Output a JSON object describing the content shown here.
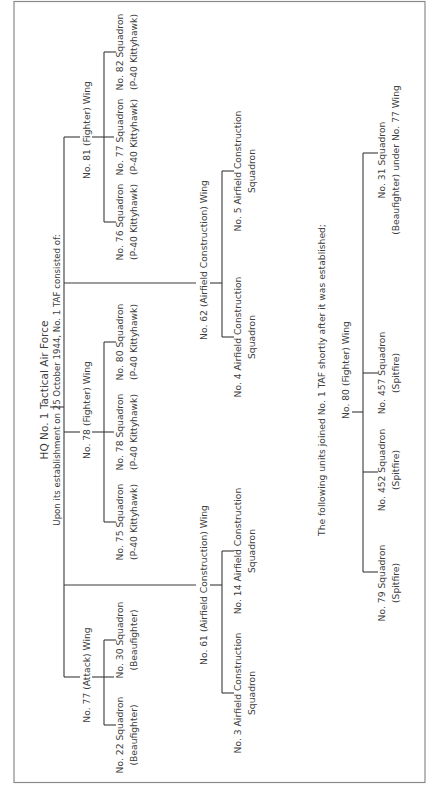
{
  "diagram": {
    "orientation": "rotated-90-ccw",
    "root": {
      "title": "HQ No. 1 Tactical Air Force",
      "subtitle": "Upon its establishment on 25 October 1944, No. 1 TAF consisted of:"
    },
    "wings": [
      {
        "name": "No. 81 (Fighter) Wing",
        "squadrons": [
          {
            "line1": "No. 76 Squadron",
            "line2": "(P-40 Kittyhawk)"
          },
          {
            "line1": "No. 77 Squadron",
            "line2": "(P-40 Kittyhawk)"
          },
          {
            "line1": "No. 82 Squadron",
            "line2": "(P-40 Kittyhawk)"
          }
        ]
      },
      {
        "name": "No. 78 (Fighter) Wing",
        "squadrons": [
          {
            "line1": "No. 75 Squadron",
            "line2": "(P-40 Kittyhawk)"
          },
          {
            "line1": "No. 78 Squadron",
            "line2": "(P-40 Kittyhawk)"
          },
          {
            "line1": "No. 80 Squadron",
            "line2": "(P-40 Kittyhawk)"
          }
        ]
      },
      {
        "name": "No. 77 (Attack) Wing",
        "squadrons": [
          {
            "line1": "No. 22 Squadron",
            "line2": "(Beaufighter)"
          },
          {
            "line1": "No. 30 Squadron",
            "line2": "(Beaufighter)"
          }
        ]
      },
      {
        "name": "No. 62 (Airfield Construction) Wing",
        "squadrons": [
          {
            "line1": "No. 4 Airfield Construction",
            "line2": "Squadron"
          },
          {
            "line1": "No. 5 Airfield Construction",
            "line2": "Squadron"
          }
        ]
      },
      {
        "name": "No. 61 (Airfield Construction) Wing",
        "squadrons": [
          {
            "line1": "No. 3 Airfield Construction",
            "line2": "Squadron"
          },
          {
            "line1": "No. 14 Airfield Construction",
            "line2": "Squadron"
          }
        ]
      }
    ],
    "later": {
      "heading": "The following units joined No. 1 TAF shortly after it was established;",
      "wing": "No. 80 (Fighter) Wing",
      "squadrons": [
        {
          "line1": "No. 79 Squadron",
          "line2": "(Spitfire)"
        },
        {
          "line1": "No. 452 Squadron",
          "line2": "(Spitfire)"
        },
        {
          "line1": "No. 457 Squadron",
          "line2": "(Spitfire)"
        },
        {
          "line1": "No. 31 Squadron",
          "line2": "(Beaufighter) under No. 77 Wing"
        }
      ]
    },
    "colors": {
      "line": "#3a3a3a",
      "text": "#3d3d3d",
      "frame": "#8a8a8a",
      "background": "#ffffff"
    }
  }
}
